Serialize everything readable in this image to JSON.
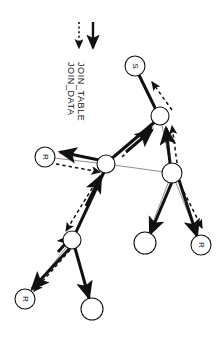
{
  "figure": {
    "title": "",
    "orientation": "rotated-90",
    "background_color": "#ffffff",
    "line_color": "#111111",
    "tree_edge_color": "#8a8a8a"
  },
  "legend": {
    "items": [
      {
        "id": "join-data",
        "label": "JOIN_DATA",
        "arrow": "dotted-down-arrow",
        "style": "dotted"
      },
      {
        "id": "join-table",
        "label": "JOIN_TABLE",
        "arrow": "solid-down-arrow",
        "style": "solid"
      }
    ]
  },
  "nodes": [
    {
      "id": "n-s",
      "label": "S",
      "type": "leaf",
      "cx": 135,
      "cy": 66,
      "r": 10
    },
    {
      "id": "n-j1",
      "label": "",
      "type": "internal",
      "cx": 160,
      "cy": 116,
      "r": 9
    },
    {
      "id": "n-j2",
      "label": "",
      "type": "internal",
      "cx": 106,
      "cy": 164,
      "r": 9
    },
    {
      "id": "n-j3",
      "label": "",
      "type": "internal",
      "cx": 172,
      "cy": 173,
      "r": 10
    },
    {
      "id": "n-j4",
      "label": "",
      "type": "internal",
      "cx": 72,
      "cy": 240,
      "r": 9
    },
    {
      "id": "n-r1",
      "label": "R",
      "type": "leaf",
      "cx": 45,
      "cy": 157,
      "r": 10
    },
    {
      "id": "n-c1",
      "label": "",
      "type": "leaf",
      "cx": 145,
      "cy": 243,
      "r": 11
    },
    {
      "id": "n-r2",
      "label": "R",
      "type": "leaf",
      "cx": 201,
      "cy": 245,
      "r": 10
    },
    {
      "id": "n-r3",
      "label": "R",
      "type": "leaf",
      "cx": 25,
      "cy": 299,
      "r": 10
    },
    {
      "id": "n-c2",
      "label": "",
      "type": "leaf",
      "cx": 92,
      "cy": 309,
      "r": 11
    }
  ],
  "tree_edges": [
    {
      "from": "n-s",
      "to": "n-j1"
    },
    {
      "from": "n-j1",
      "to": "n-j2"
    },
    {
      "from": "n-j1",
      "to": "n-j3"
    },
    {
      "from": "n-j2",
      "to": "n-j3"
    },
    {
      "from": "n-j2",
      "to": "n-r1"
    },
    {
      "from": "n-j2",
      "to": "n-j4"
    },
    {
      "from": "n-j3",
      "to": "n-c1"
    },
    {
      "from": "n-j3",
      "to": "n-r2"
    },
    {
      "from": "n-j4",
      "to": "n-r3"
    },
    {
      "from": "n-j4",
      "to": "n-c2"
    }
  ],
  "join_table_arrows": [
    {
      "from": "n-s",
      "to": "n-j1",
      "direction": "up"
    },
    {
      "from": "n-j2",
      "to": "n-j1",
      "direction": "up"
    },
    {
      "from": "n-j3",
      "to": "n-j1",
      "direction": "up"
    },
    {
      "from": "n-j2",
      "to": "n-r1",
      "direction": "out"
    },
    {
      "from": "n-j4",
      "to": "n-j2",
      "direction": "up"
    },
    {
      "from": "n-j3",
      "to": "n-c1",
      "direction": "down"
    },
    {
      "from": "n-j3",
      "to": "n-r2",
      "direction": "down"
    },
    {
      "from": "n-j4",
      "to": "n-r3",
      "direction": "down"
    },
    {
      "from": "n-j4",
      "to": "n-c2",
      "direction": "down"
    }
  ],
  "join_data_arrows": [
    {
      "from": "n-s",
      "to": "n-j1",
      "direction": "up"
    },
    {
      "from": "n-j3",
      "to": "n-j1",
      "direction": "up"
    },
    {
      "from": "n-r1",
      "to": "n-j2",
      "direction": "in"
    },
    {
      "from": "n-j2",
      "to": "n-j4",
      "direction": "down"
    },
    {
      "from": "n-j3",
      "to": "n-r2",
      "direction": "down"
    },
    {
      "from": "n-j4",
      "to": "n-r3",
      "direction": "down"
    }
  ]
}
